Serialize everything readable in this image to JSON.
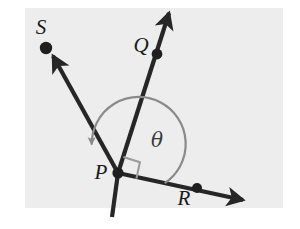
{
  "figure": {
    "canvas": {
      "width": 300,
      "height": 229
    },
    "panel": {
      "x": 25,
      "y": 8,
      "width": 258,
      "height": 200,
      "fill": "#ededed"
    },
    "colors": {
      "ray": "#262626",
      "dot": "#1f1f1f",
      "arc": "#8a8a8a",
      "right_angle": "#9a9a9a",
      "label": "#1a1a1a",
      "background": "#ffffff",
      "panel": "#ededed"
    },
    "vertex": {
      "name": "P",
      "x": 118,
      "y": 173
    },
    "points": [
      {
        "id": "S",
        "label": "S",
        "x": 46,
        "y": 48,
        "label_x": 41,
        "label_y": 34,
        "dot": true
      },
      {
        "id": "Q",
        "label": "Q",
        "x": 157,
        "y": 54,
        "label_x": 141,
        "label_y": 52,
        "dot": true
      },
      {
        "id": "P",
        "label": "P",
        "x": 118,
        "y": 173,
        "label_x": 101,
        "label_y": 179,
        "dot": false
      },
      {
        "id": "R",
        "label": "R",
        "x": 197,
        "y": 188,
        "label_x": 184,
        "label_y": 205,
        "dot": true
      }
    ],
    "rays": [
      {
        "id": "ray-PQ",
        "from": "P",
        "through": "Q",
        "tip_x": 169,
        "tip_y": 13,
        "tail_x": 112,
        "tail_y": 217,
        "arrowhead": true,
        "extends_past_vertex": true
      },
      {
        "id": "ray-PS",
        "from": "P",
        "through": "S",
        "tip_x": 53,
        "tip_y": 56,
        "arrowhead": true,
        "extends_past_vertex": false
      },
      {
        "id": "ray-PR",
        "from": "P",
        "through": "R",
        "tip_x": 243,
        "tip_y": 200,
        "arrowhead": true,
        "extends_past_vertex": false
      }
    ],
    "angle_arc": {
      "id": "theta-arc",
      "label": "θ",
      "label_x": 157,
      "label_y": 147,
      "radius": 47,
      "start_ray": "ray-PR",
      "end_ray": "ray-PS",
      "direction": "counterclockwise",
      "arrowhead_at": "end",
      "arrow_x": 107,
      "arrow_y": 133
    },
    "right_angle_marker": {
      "id": "right-angle-marker",
      "between": [
        "ray-PQ",
        "ray-PR"
      ],
      "size": 17,
      "at_vertex": "P"
    }
  }
}
